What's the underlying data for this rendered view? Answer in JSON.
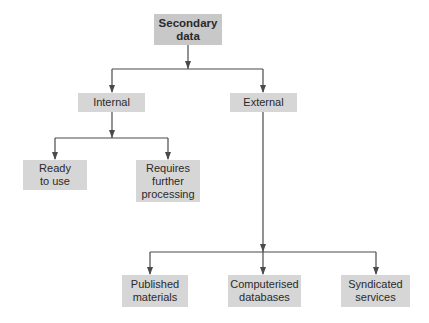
{
  "diagram": {
    "root": {
      "label": "Secondary\ndata"
    },
    "level1": [
      {
        "label": "Internal"
      },
      {
        "label": "External"
      }
    ],
    "internal_children": [
      {
        "label": "Ready\nto use"
      },
      {
        "label": "Requires\nfurther\nprocessing"
      }
    ],
    "external_children": [
      {
        "label": "Published\nmaterials"
      },
      {
        "label": "Computerised\ndatabases"
      },
      {
        "label": "Syndicated\nservices"
      }
    ],
    "colors": {
      "box_fill": "#d6d6d6",
      "root_fill": "#c8c8c8",
      "line": "#4a4a4a",
      "text": "#2a2a2a"
    }
  }
}
